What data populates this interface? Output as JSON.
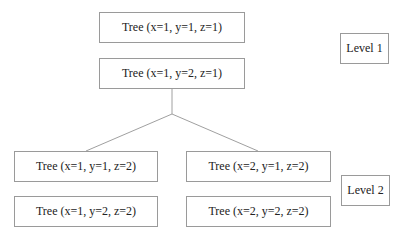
{
  "diagram": {
    "nodes": [
      {
        "id": "n1",
        "label": "Tree (x=1, y=1, z=1)",
        "level": 1
      },
      {
        "id": "n2",
        "label": "Tree (x=1, y=2, z=1)",
        "level": 1
      },
      {
        "id": "n3",
        "label": "Tree (x=1, y=1, z=2)",
        "level": 2
      },
      {
        "id": "n4",
        "label": "Tree (x=2, y=1, z=2)",
        "level": 2
      },
      {
        "id": "n5",
        "label": "Tree (x=1, y=2, z=2)",
        "level": 2
      },
      {
        "id": "n6",
        "label": "Tree (x=2, y=2, z=2)",
        "level": 2
      }
    ],
    "levels": [
      {
        "label": "Level 1"
      },
      {
        "label": "Level 2"
      }
    ],
    "edges": [
      {
        "from": "n2",
        "to": "n3"
      },
      {
        "from": "n2",
        "to": "n4"
      }
    ],
    "colors": {
      "border": "#9a9a9a",
      "line": "#a0a0a0",
      "text": "#222222"
    }
  }
}
